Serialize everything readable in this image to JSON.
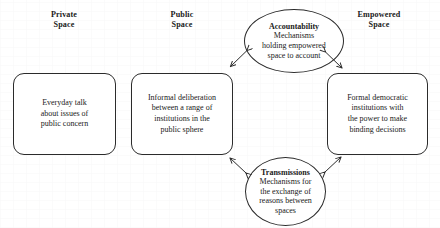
{
  "diagram": {
    "background_color": "#ffffff",
    "stroke_color": "#2b2b2b",
    "text_color": "#1a1a1a"
  },
  "columns": [
    {
      "id": "private",
      "label": "Private\nSpace"
    },
    {
      "id": "public",
      "label": "Public\nSpace"
    },
    {
      "id": "empowered",
      "label": "Empowered\nSpace"
    }
  ],
  "boxes": [
    {
      "id": "private-space-box",
      "text": "Everyday talk\nabout issues of\npublic concern"
    },
    {
      "id": "public-space-box",
      "text": "Informal deliberation\nbetween a range of\ninstitutions in the\npublic sphere"
    },
    {
      "id": "empowered-space-box",
      "text": "Formal democratic\ninstitutions with\nthe power to make\nbinding decisions"
    }
  ],
  "ellipses": [
    {
      "id": "accountability-ellipse",
      "title": "Accountability",
      "text": "Mechanisms\nholding empowered\nspace to account"
    },
    {
      "id": "transmissions-ellipse",
      "title": "Transmissions",
      "text": "Mechanisms for\nthe exchange of\nreasons between\nspaces"
    }
  ],
  "connectors": [
    {
      "id": "accountability-to-public",
      "style": "double-headed-arrow",
      "from": "accountability-ellipse",
      "to": "public-space-box"
    },
    {
      "id": "accountability-to-empowered",
      "style": "double-headed-arrow",
      "from": "accountability-ellipse",
      "to": "empowered-space-box"
    },
    {
      "id": "transmissions-to-public",
      "style": "double-headed-arrow",
      "from": "transmissions-ellipse",
      "to": "public-space-box"
    },
    {
      "id": "transmissions-to-empowered",
      "style": "double-headed-arrow",
      "from": "transmissions-ellipse",
      "to": "empowered-space-box"
    }
  ]
}
